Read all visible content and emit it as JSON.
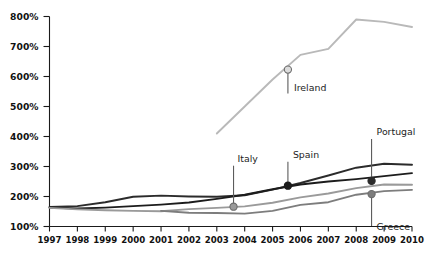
{
  "chart_data": {
    "type": "line",
    "title": "",
    "subtitle": "",
    "xlabel": "",
    "ylabel": "",
    "xlim": [
      1997,
      2010
    ],
    "ylim": [
      100,
      800
    ],
    "grid": false,
    "legend_position": "inline-callouts",
    "x_tick_labels": [
      "1997",
      "1998",
      "1999",
      "2000",
      "2001",
      "2002",
      "2003",
      "2004",
      "2005",
      "2006",
      "2007",
      "2008",
      "2009",
      "2010"
    ],
    "y_tick_labels": [
      "100%",
      "200%",
      "300%",
      "400%",
      "500%",
      "600%",
      "700%",
      "800%"
    ],
    "y_tick_values": [
      100,
      200,
      300,
      400,
      500,
      600,
      700,
      800
    ],
    "x": [
      1997,
      1998,
      1999,
      2000,
      2001,
      2002,
      2003,
      2004,
      2005,
      2006,
      2007,
      2008,
      2009,
      2010
    ],
    "series": [
      {
        "name": "Ireland",
        "color": "#b9b9b9",
        "width": 1.9,
        "x": [
          2003,
          2004,
          2005,
          2006,
          2007,
          2008,
          2009,
          2010
        ],
        "values": [
          410,
          500,
          590,
          672,
          692,
          790,
          782,
          765
        ]
      },
      {
        "name": "Portugal",
        "color": "#2b2b2b",
        "width": 1.9,
        "x": [
          1997,
          1998,
          1999,
          2000,
          2001,
          2002,
          2003,
          2004,
          2005,
          2006,
          2007,
          2008,
          2009,
          2010
        ],
        "values": [
          165,
          168,
          181,
          199,
          203,
          200,
          199,
          204,
          223,
          245,
          270,
          296,
          309,
          306
        ]
      },
      {
        "name": "Spain",
        "color": "#1c1c1c",
        "width": 1.9,
        "x": [
          1997,
          1998,
          1999,
          2000,
          2001,
          2002,
          2003,
          2004,
          2005,
          2006,
          2007,
          2008,
          2009,
          2010
        ],
        "values": [
          163,
          160,
          163,
          168,
          173,
          180,
          192,
          206,
          224,
          240,
          250,
          258,
          268,
          278
        ]
      },
      {
        "name": "Italy",
        "color": "#9a9a9a",
        "width": 1.9,
        "x": [
          1997,
          1998,
          1999,
          2000,
          2001,
          2002,
          2003,
          2004,
          2005,
          2006,
          2007,
          2008,
          2009,
          2010
        ],
        "values": [
          162,
          157,
          154,
          152,
          151,
          158,
          162,
          167,
          179,
          197,
          210,
          228,
          240,
          239
        ]
      },
      {
        "name": "Greece",
        "color": "#7d7d7d",
        "width": 1.9,
        "x": [
          2001,
          2002,
          2003,
          2004,
          2005,
          2006,
          2007,
          2008,
          2009,
          2010
        ],
        "values": [
          152,
          146,
          145,
          143,
          152,
          172,
          181,
          206,
          218,
          222
        ]
      }
    ],
    "annotations": [
      {
        "label": "Ireland",
        "x": 2005.55,
        "y": 623,
        "marker": "open-circle",
        "marker_fill": "#dcdcdc",
        "marker_stroke": "#6d6d6d",
        "leader_length": 24,
        "label_dx": 6,
        "label_dy": 21
      },
      {
        "label": "Italy",
        "x": 2003.6,
        "y": 166,
        "marker": "filled-circle",
        "marker_fill": "#9a9a9a",
        "marker_stroke": "#6d6d6d",
        "leader_length": -41,
        "label_dx": 4,
        "label_dy": -45
      },
      {
        "label": "Spain",
        "x": 2005.55,
        "y": 236,
        "marker": "filled-circle",
        "marker_fill": "#1c1c1c",
        "marker_stroke": "#1c1c1c",
        "leader_length": -24,
        "label_dx": 5,
        "label_dy": -28
      },
      {
        "label": "Portugal",
        "x": 2008.55,
        "y": 252,
        "marker": "filled-circle",
        "marker_fill": "#2b2b2b",
        "marker_stroke": "#2b2b2b",
        "leader_length": -42,
        "label_dx": 5,
        "label_dy": -46
      },
      {
        "label": "Greece",
        "x": 2008.55,
        "y": 208,
        "marker": "filled-circle",
        "marker_fill": "#7d7d7d",
        "marker_stroke": "#6d6d6d",
        "leader_length": 32,
        "label_dx": 5,
        "label_dy": 36
      }
    ]
  }
}
